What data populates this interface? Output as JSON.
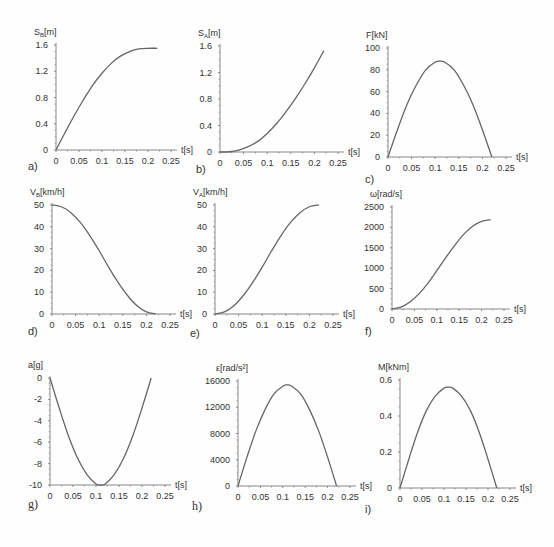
{
  "chart_data": [
    {
      "id": "a",
      "panel_label": "a)",
      "type": "line",
      "ylabel": "S_B[m]",
      "xlabel": "t[s]",
      "xticks": [
        "0",
        "0.05",
        "0.1",
        "0.15",
        "0.2",
        "0.25"
      ],
      "yticks": [
        "0",
        "0.4",
        "0.8",
        "1.2",
        "1.6"
      ],
      "xlim": [
        0,
        0.25
      ],
      "ylim": [
        0,
        1.6
      ],
      "x": [
        0,
        0.02,
        0.04,
        0.06,
        0.08,
        0.1,
        0.12,
        0.14,
        0.16,
        0.18,
        0.2,
        0.22
      ],
      "y": [
        0,
        0.27,
        0.53,
        0.77,
        0.99,
        1.17,
        1.32,
        1.43,
        1.5,
        1.54,
        1.55,
        1.55
      ]
    },
    {
      "id": "b",
      "panel_label": "b)",
      "type": "line",
      "ylabel": "S_A[m]",
      "xlabel": "t[s]",
      "xticks": [
        "0",
        "0.05",
        "0.1",
        "0.15",
        "0.2",
        "0.25"
      ],
      "yticks": [
        "0",
        "0.4",
        "0.8",
        "1.2",
        "1.6"
      ],
      "xlim": [
        0,
        0.25
      ],
      "ylim": [
        0,
        1.6
      ],
      "x": [
        0,
        0.02,
        0.04,
        0.06,
        0.08,
        0.1,
        0.12,
        0.14,
        0.16,
        0.18,
        0.2,
        0.22
      ],
      "y": [
        0,
        0.004,
        0.03,
        0.08,
        0.16,
        0.28,
        0.43,
        0.61,
        0.81,
        1.03,
        1.27,
        1.53
      ]
    },
    {
      "id": "c",
      "panel_label": "c)",
      "type": "line",
      "ylabel": "F[kN]",
      "xlabel": "t[s]",
      "xticks": [
        "0",
        "0.05",
        "0.1",
        "0.15",
        "0.2",
        "0.25"
      ],
      "yticks": [
        "0",
        "20",
        "40",
        "60",
        "80",
        "100"
      ],
      "xlim": [
        0,
        0.25
      ],
      "ylim": [
        0,
        100
      ],
      "x": [
        0,
        0.02,
        0.04,
        0.06,
        0.08,
        0.1,
        0.11,
        0.12,
        0.14,
        0.16,
        0.18,
        0.2,
        0.22
      ],
      "y": [
        0,
        25,
        48,
        66,
        80,
        87,
        88,
        87,
        80,
        66,
        48,
        25,
        0
      ]
    },
    {
      "id": "d",
      "panel_label": "d)",
      "type": "line",
      "ylabel": "V_B[km/h]",
      "xlabel": "t[s]",
      "xticks": [
        "0",
        "0.05",
        "0.1",
        "0.15",
        "0.2",
        "0.25"
      ],
      "yticks": [
        "0",
        "10",
        "20",
        "30",
        "40",
        "50"
      ],
      "xlim": [
        0,
        0.25
      ],
      "ylim": [
        0,
        50
      ],
      "x": [
        0,
        0.02,
        0.04,
        0.06,
        0.08,
        0.1,
        0.12,
        0.14,
        0.16,
        0.18,
        0.2,
        0.22
      ],
      "y": [
        50,
        49.2,
        46.5,
        42,
        36,
        29,
        21.5,
        14.5,
        8.5,
        3.8,
        1,
        0
      ]
    },
    {
      "id": "e",
      "panel_label": "e)",
      "type": "line",
      "ylabel": "V_A[km/h]",
      "xlabel": "t[s]",
      "xticks": [
        "0",
        "0.05",
        "0.1",
        "0.15",
        "0.2",
        "0.25"
      ],
      "yticks": [
        "0",
        "10",
        "20",
        "30",
        "40",
        "50"
      ],
      "xlim": [
        0,
        0.25
      ],
      "ylim": [
        0,
        50
      ],
      "x": [
        0,
        0.02,
        0.04,
        0.06,
        0.08,
        0.1,
        0.12,
        0.14,
        0.16,
        0.18,
        0.2,
        0.22
      ],
      "y": [
        0,
        1,
        3.8,
        8.5,
        14.5,
        21.5,
        29,
        36,
        42,
        46.5,
        49.2,
        50
      ]
    },
    {
      "id": "f",
      "panel_label": "f)",
      "type": "line",
      "ylabel": "ω[rad/s]",
      "xlabel": "t[s]",
      "xticks": [
        "0",
        "0.05",
        "0.1",
        "0.15",
        "0.2",
        "0.25"
      ],
      "yticks": [
        "0",
        "500",
        "1000",
        "1500",
        "2000",
        "2500"
      ],
      "xlim": [
        0,
        0.25
      ],
      "ylim": [
        0,
        2500
      ],
      "x": [
        0,
        0.02,
        0.04,
        0.06,
        0.08,
        0.1,
        0.12,
        0.14,
        0.16,
        0.18,
        0.2,
        0.22
      ],
      "y": [
        0,
        45,
        170,
        370,
        630,
        940,
        1260,
        1560,
        1830,
        2030,
        2150,
        2190
      ]
    },
    {
      "id": "g",
      "panel_label": "g)",
      "type": "line",
      "ylabel": "a[g]",
      "xlabel": "t[s]",
      "xticks": [
        "0",
        "0.05",
        "0.1",
        "0.15",
        "0.2",
        "0.25"
      ],
      "yticks": [
        "-10",
        "-8",
        "-6",
        "-4",
        "-2",
        "0"
      ],
      "xlim": [
        0,
        0.25
      ],
      "ylim": [
        -10,
        0
      ],
      "x": [
        0,
        0.02,
        0.04,
        0.06,
        0.08,
        0.1,
        0.11,
        0.12,
        0.14,
        0.16,
        0.18,
        0.2,
        0.22
      ],
      "y": [
        0,
        -2.8,
        -5.4,
        -7.5,
        -9.0,
        -9.9,
        -10,
        -9.9,
        -9.0,
        -7.5,
        -5.4,
        -2.8,
        0
      ]
    },
    {
      "id": "h",
      "panel_label": "h)",
      "type": "line",
      "ylabel": "ε[rad/s²]",
      "xlabel": "t[s]",
      "xticks": [
        "0",
        "0.05",
        "0.1",
        "0.15",
        "0.2",
        "0.25"
      ],
      "yticks": [
        "0",
        "4000",
        "8000",
        "12000",
        "16000"
      ],
      "xlim": [
        0,
        0.25
      ],
      "ylim": [
        0,
        16000
      ],
      "x": [
        0,
        0.02,
        0.04,
        0.06,
        0.08,
        0.1,
        0.11,
        0.12,
        0.14,
        0.16,
        0.18,
        0.2,
        0.22
      ],
      "y": [
        0,
        4400,
        8400,
        11600,
        14000,
        15200,
        15400,
        15200,
        14000,
        11600,
        8400,
        4400,
        0
      ]
    },
    {
      "id": "i",
      "panel_label": "i)",
      "type": "line",
      "ylabel": "M[kNm]",
      "xlabel": "t[s]",
      "xticks": [
        "0",
        "0.05",
        "0.1",
        "0.15",
        "0.2",
        "0.25"
      ],
      "yticks": [
        "0",
        "0.2",
        "0.4",
        "0.6"
      ],
      "xlim": [
        0,
        0.25
      ],
      "ylim": [
        0,
        0.6
      ],
      "x": [
        0,
        0.02,
        0.04,
        0.06,
        0.08,
        0.1,
        0.11,
        0.12,
        0.14,
        0.16,
        0.18,
        0.2,
        0.22
      ],
      "y": [
        0,
        0.16,
        0.31,
        0.43,
        0.51,
        0.555,
        0.56,
        0.555,
        0.51,
        0.43,
        0.31,
        0.16,
        0
      ]
    }
  ],
  "layout": [
    {
      "ox": 56,
      "oy": 150,
      "w": 115,
      "h": 105,
      "ylab_sub": "B",
      "ylab_main": "S",
      "ylab_rest": "[m]",
      "tag_x": 28,
      "tag_y": 160,
      "tag_serif": false
    },
    {
      "ox": 220,
      "oy": 152,
      "w": 118,
      "h": 106,
      "ylab_sub": "A",
      "ylab_main": "S",
      "ylab_rest": "[m]",
      "tag_x": 196,
      "tag_y": 163,
      "tag_serif": false
    },
    {
      "ox": 388,
      "oy": 157,
      "w": 118,
      "h": 109,
      "ylab_sub": "",
      "ylab_main": "F[kN]",
      "ylab_rest": "",
      "tag_x": 365,
      "tag_y": 173,
      "tag_serif": false
    },
    {
      "ox": 52,
      "oy": 314,
      "w": 118,
      "h": 109,
      "ylab_sub": "B",
      "ylab_main": "V",
      "ylab_rest": "[km/h]",
      "tag_x": 28,
      "tag_y": 325,
      "tag_serif": false
    },
    {
      "ox": 215,
      "oy": 314,
      "w": 118,
      "h": 109,
      "ylab_sub": "A",
      "ylab_main": "V",
      "ylab_rest": "[km/h]",
      "tag_x": 190,
      "tag_y": 327,
      "tag_serif": false
    },
    {
      "ox": 392,
      "oy": 309,
      "w": 112,
      "h": 102,
      "ylab_sub": "",
      "ylab_main": "ω[rad/s]",
      "ylab_rest": "",
      "tag_x": 365,
      "tag_y": 325,
      "tag_serif": false
    },
    {
      "ox": 50,
      "oy": 485,
      "w": 115,
      "h": 107,
      "ylab_sub": "",
      "ylab_main": "a[g]",
      "ylab_rest": "",
      "tag_x": 28,
      "tag_y": 497,
      "tag_serif": true
    },
    {
      "ox": 238,
      "oy": 486,
      "w": 112,
      "h": 105,
      "ylab_sub": "",
      "ylab_main": "ε[rad/s²]",
      "ylab_rest": "",
      "tag_x": 192,
      "tag_y": 499,
      "tag_serif": true
    },
    {
      "ox": 400,
      "oy": 488,
      "w": 110,
      "h": 108,
      "ylab_sub": "",
      "ylab_main": "M[kNm]",
      "ylab_rest": "",
      "tag_x": 365,
      "tag_y": 503,
      "tag_serif": false
    }
  ],
  "style": {
    "line_color": "#666666",
    "axis_color": "#888888",
    "text_color": "#333333",
    "background": "#fefefe"
  }
}
